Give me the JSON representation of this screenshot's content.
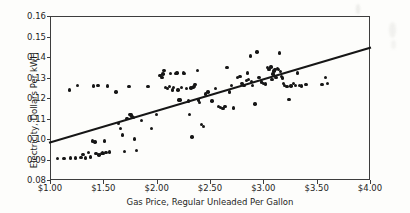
{
  "chart_data": {
    "type": "scatter",
    "title": "",
    "xlabel": "Gas Price, Regular Unleaded Per Gallon",
    "ylabel": "Electricity, Dollars Per kWH",
    "xlim": [
      1.0,
      4.0
    ],
    "ylim": [
      0.08,
      0.16
    ],
    "grid": false,
    "legend": null,
    "xticks": [
      1.0,
      1.5,
      2.0,
      2.5,
      3.0,
      3.5,
      4.0
    ],
    "xtick_labels": [
      "$1.00",
      "$1.50",
      "$2.00",
      "$2.50",
      "$3.00",
      "$3.50",
      "$4.00"
    ],
    "yticks": [
      0.08,
      0.09,
      0.1,
      0.11,
      0.12,
      0.13,
      0.14,
      0.15,
      0.16
    ],
    "ytick_labels": [
      "0.08",
      "0.09",
      "0.10",
      "0.11",
      "0.12",
      "0.13",
      "0.14",
      "0.15",
      "0.16"
    ],
    "series": [
      {
        "name": "observations",
        "marker": "circle",
        "color": "#161616",
        "points": [
          [
            1.07,
            0.0905
          ],
          [
            1.13,
            0.0905
          ],
          [
            1.18,
            0.124
          ],
          [
            1.19,
            0.0907
          ],
          [
            1.24,
            0.0908
          ],
          [
            1.26,
            0.126
          ],
          [
            1.29,
            0.091
          ],
          [
            1.31,
            0.0925
          ],
          [
            1.33,
            0.0908
          ],
          [
            1.36,
            0.0935
          ],
          [
            1.38,
            0.0912
          ],
          [
            1.4,
            0.099
          ],
          [
            1.41,
            0.1258
          ],
          [
            1.42,
            0.0985
          ],
          [
            1.43,
            0.093
          ],
          [
            1.45,
            0.126
          ],
          [
            1.46,
            0.0922
          ],
          [
            1.48,
            0.093
          ],
          [
            1.49,
            0.0932
          ],
          [
            1.5,
            0.0928
          ],
          [
            1.51,
            0.099
          ],
          [
            1.52,
            0.0935
          ],
          [
            1.53,
            0.0934
          ],
          [
            1.54,
            0.1258
          ],
          [
            1.56,
            0.0936
          ],
          [
            1.62,
            0.123
          ],
          [
            1.64,
            0.1075
          ],
          [
            1.66,
            0.105
          ],
          [
            1.68,
            0.102
          ],
          [
            1.7,
            0.094
          ],
          [
            1.72,
            0.11
          ],
          [
            1.74,
            0.1255
          ],
          [
            1.75,
            0.112
          ],
          [
            1.76,
            0.1118
          ],
          [
            1.77,
            0.111
          ],
          [
            1.78,
            0.1105
          ],
          [
            1.79,
            0.1
          ],
          [
            1.81,
            0.0944
          ],
          [
            1.86,
            0.109
          ],
          [
            1.92,
            0.1255
          ],
          [
            1.95,
            0.105
          ],
          [
            2.0,
            0.112
          ],
          [
            2.03,
            0.131
          ],
          [
            2.05,
            0.13
          ],
          [
            2.06,
            0.1318
          ],
          [
            2.07,
            0.1335
          ],
          [
            2.08,
            0.125
          ],
          [
            2.1,
            0.1245
          ],
          [
            2.12,
            0.1255
          ],
          [
            2.13,
            0.132
          ],
          [
            2.15,
            0.124
          ],
          [
            2.16,
            0.125
          ],
          [
            2.18,
            0.132
          ],
          [
            2.19,
            0.1322
          ],
          [
            2.2,
            0.124
          ],
          [
            2.21,
            0.119
          ],
          [
            2.22,
            0.119
          ],
          [
            2.23,
            0.125
          ],
          [
            2.25,
            0.1322
          ],
          [
            2.26,
            0.132
          ],
          [
            2.28,
            0.1245
          ],
          [
            2.3,
            0.1185
          ],
          [
            2.31,
            0.112
          ],
          [
            2.32,
            0.1248
          ],
          [
            2.33,
            0.101
          ],
          [
            2.34,
            0.125
          ],
          [
            2.35,
            0.1255
          ],
          [
            2.36,
            0.1265
          ],
          [
            2.38,
            0.1335
          ],
          [
            2.39,
            0.119
          ],
          [
            2.4,
            0.1178
          ],
          [
            2.42,
            0.1072
          ],
          [
            2.44,
            0.106
          ],
          [
            2.46,
            0.122
          ],
          [
            2.48,
            0.123
          ],
          [
            2.52,
            0.1185
          ],
          [
            2.55,
            0.1245
          ],
          [
            2.58,
            0.116
          ],
          [
            2.6,
            0.1155
          ],
          [
            2.62,
            0.115
          ],
          [
            2.64,
            0.1158
          ],
          [
            2.66,
            0.135
          ],
          [
            2.68,
            0.123
          ],
          [
            2.7,
            0.126
          ],
          [
            2.72,
            0.1152
          ],
          [
            2.76,
            0.13
          ],
          [
            2.78,
            0.1305
          ],
          [
            2.8,
            0.127
          ],
          [
            2.82,
            0.126
          ],
          [
            2.84,
            0.1285
          ],
          [
            2.85,
            0.1322
          ],
          [
            2.86,
            0.129
          ],
          [
            2.88,
            0.1405
          ],
          [
            2.89,
            0.1282
          ],
          [
            2.9,
            0.1262
          ],
          [
            2.92,
            0.117
          ],
          [
            2.94,
            0.1425
          ],
          [
            2.96,
            0.13
          ],
          [
            2.98,
            0.1278
          ],
          [
            3.0,
            0.1272
          ],
          [
            3.02,
            0.1268
          ],
          [
            3.04,
            0.135
          ],
          [
            3.05,
            0.134
          ],
          [
            3.06,
            0.1338
          ],
          [
            3.07,
            0.1352
          ],
          [
            3.08,
            0.129
          ],
          [
            3.09,
            0.1318
          ],
          [
            3.1,
            0.1332
          ],
          [
            3.11,
            0.134
          ],
          [
            3.12,
            0.13
          ],
          [
            3.13,
            0.1345
          ],
          [
            3.14,
            0.1338
          ],
          [
            3.15,
            0.142
          ],
          [
            3.16,
            0.133
          ],
          [
            3.17,
            0.1305
          ],
          [
            3.18,
            0.1298
          ],
          [
            3.19,
            0.127
          ],
          [
            3.2,
            0.1262
          ],
          [
            3.22,
            0.1255
          ],
          [
            3.24,
            0.1192
          ],
          [
            3.26,
            0.1258
          ],
          [
            3.28,
            0.127
          ],
          [
            3.3,
            0.1262
          ],
          [
            3.32,
            0.1322
          ],
          [
            3.34,
            0.126
          ],
          [
            3.36,
            0.1258
          ],
          [
            3.4,
            0.1265
          ],
          [
            3.55,
            0.1265
          ],
          [
            3.58,
            0.13
          ],
          [
            3.6,
            0.1272
          ]
        ]
      }
    ],
    "trend_line": {
      "name": "linear fit",
      "color": "#161616",
      "x0": 1.0,
      "y0": 0.0983,
      "x1": 4.0,
      "y1": 0.1445
    }
  }
}
